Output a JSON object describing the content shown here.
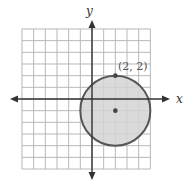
{
  "chart_data": {
    "type": "scatter",
    "title": "",
    "xlabel": "x",
    "ylabel": "y",
    "xlim": [
      -6,
      5
    ],
    "ylim": [
      -6,
      6
    ],
    "grid": true,
    "grid_step": 1,
    "shapes": [
      {
        "kind": "circle",
        "center": [
          2,
          -1
        ],
        "radius": 3,
        "filled": true,
        "fill_color": "#d4d4d4",
        "stroke_color": "#555555"
      }
    ],
    "points": [
      {
        "x": 2,
        "y": 2,
        "label": "(2, 2)"
      },
      {
        "x": 2,
        "y": -1,
        "label": ""
      }
    ],
    "annotations": [
      "(2, 2)"
    ],
    "legend": null
  },
  "labels": {
    "x_axis": "x",
    "y_axis": "y",
    "point_label": "(2, 2)"
  },
  "colors": {
    "grid": "#b8b8b8",
    "axis": "#333333",
    "circle_fill": "#d4d4d4",
    "circle_stroke": "#555555",
    "point": "#444444"
  }
}
